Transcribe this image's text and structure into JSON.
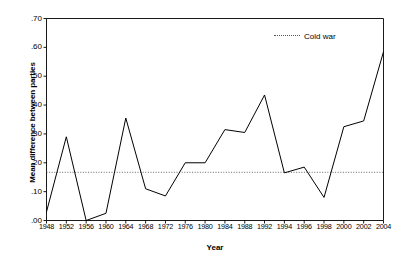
{
  "chart_data": {
    "type": "line",
    "title": "",
    "xlabel": "Year",
    "ylabel": "Mean difference between parties",
    "categories": [
      "1948",
      "1952",
      "1956",
      "1960",
      "1964",
      "1968",
      "1972",
      "1976",
      "1980",
      "1984",
      "1988",
      "1992",
      "1994",
      "1996",
      "1998",
      "2000",
      "2002",
      "2004"
    ],
    "series": [
      {
        "name": "Mean difference between parties",
        "values": [
          0.03,
          0.29,
          0.0,
          0.025,
          0.355,
          0.11,
          0.085,
          0.2,
          0.2,
          0.315,
          0.305,
          0.435,
          0.165,
          0.185,
          0.08,
          0.325,
          0.345,
          0.585
        ],
        "style": "solid",
        "color": "#000000"
      }
    ],
    "reference_lines": [
      {
        "name": "Cold war",
        "value": 0.167,
        "style": "dotted",
        "color": "#555555"
      }
    ],
    "ylim": [
      0.0,
      0.7
    ],
    "ytick_values": [
      0.0,
      0.1,
      0.2,
      0.3,
      0.4,
      0.5,
      0.6,
      0.7
    ],
    "ytick_labels": [
      ".00",
      ".10",
      ".20",
      ".30",
      ".40",
      ".50",
      ".60",
      ".70"
    ],
    "grid": false,
    "legend_position": "top-right",
    "legend_entries": [
      "Cold war"
    ]
  },
  "legend": {
    "cold_war_label": "Cold war"
  },
  "axes": {
    "x_title": "Year",
    "y_title": "Mean difference between parties"
  }
}
